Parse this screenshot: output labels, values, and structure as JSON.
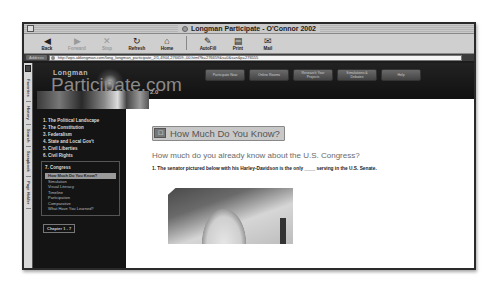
{
  "window": {
    "title": "Longman Participate - O'Connor 2002"
  },
  "toolbar": {
    "buttons": [
      {
        "label": "Back",
        "icon": "back-arrow-icon",
        "glyph": "◀",
        "enabled": true
      },
      {
        "label": "Forward",
        "icon": "forward-arrow-icon",
        "glyph": "▶",
        "enabled": false
      },
      {
        "label": "Stop",
        "icon": "stop-icon",
        "glyph": "✕",
        "enabled": false
      },
      {
        "label": "Refresh",
        "icon": "refresh-icon",
        "glyph": "↻",
        "enabled": true
      },
      {
        "label": "Home",
        "icon": "home-icon",
        "glyph": "⌂",
        "enabled": true
      },
      {
        "label": "AutoFill",
        "icon": "autofill-icon",
        "glyph": "✎",
        "enabled": true
      },
      {
        "label": "Print",
        "icon": "print-icon",
        "glyph": "▤",
        "enabled": true
      },
      {
        "label": "Mail",
        "icon": "mail-icon",
        "glyph": "✉",
        "enabled": true
      }
    ]
  },
  "address_bar": {
    "label": "Address",
    "url": "http://wps.ablongman.com/long_longman_participate_2/1,4904,276659-,00.html?b=276659&s=0&s=n&p=276555"
  },
  "side_tabs": [
    "Favorites",
    "History",
    "Search",
    "Scrapbook",
    "Page Holder"
  ],
  "site": {
    "logo_small": "Longman",
    "logo_big": "Participate.com",
    "logo_version": "2.0",
    "nav_buttons": [
      "Participate Now",
      "Online Rooms",
      "Research Your Projects",
      "Simulations & Debates",
      "Help"
    ]
  },
  "left_nav": {
    "chapters": [
      "1. The Political Landscape",
      "2. The Constitution",
      "3. Federalism",
      "4. State and Local Gov't",
      "5. Civil Liberties",
      "6. Civil Rights"
    ],
    "current_chapter": "7. Congress",
    "sub_items": [
      {
        "label": "How Much Do You Know?",
        "active": true
      },
      {
        "label": "Simulation",
        "active": false
      },
      {
        "label": "Visual Literacy",
        "active": false
      },
      {
        "label": "Timeline",
        "active": false
      },
      {
        "label": "Participation",
        "active": false
      },
      {
        "label": "Comparative",
        "active": false
      },
      {
        "label": "What Have You Learned?",
        "active": false
      }
    ],
    "chapter_selector": "Chapter 1 - 7"
  },
  "main": {
    "section_title": "How Much Do You Know?",
    "intro": "How much do you already know about the U.S. Congress?",
    "question": "1. The senator pictured below with his Harley-Davidson is the only ____ serving in the U.S. Senate.",
    "image_alt": "U.S. Capitol dome"
  }
}
